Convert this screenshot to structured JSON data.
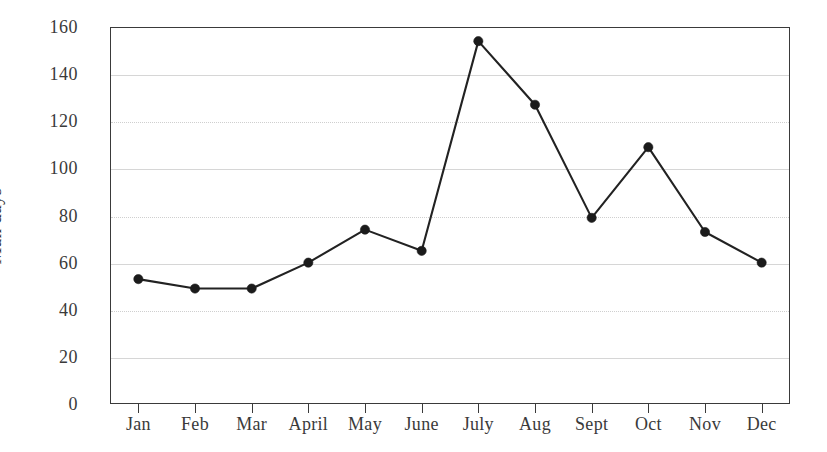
{
  "chart_data": {
    "type": "line",
    "title": "",
    "xlabel": "",
    "ylabel": "Man days",
    "categories": [
      "Jan",
      "Feb",
      "Mar",
      "April",
      "May",
      "June",
      "July",
      "Aug",
      "Sept",
      "Oct",
      "Nov",
      "Dec"
    ],
    "values": [
      53,
      49,
      49,
      60,
      74,
      65,
      154,
      127,
      79,
      109,
      73,
      60
    ],
    "series": [
      {
        "name": "Man days",
        "values": [
          53,
          49,
          49,
          60,
          74,
          65,
          154,
          127,
          79,
          109,
          73,
          60
        ]
      }
    ],
    "ylim": [
      0,
      160
    ],
    "yticks": [
      0,
      20,
      40,
      60,
      80,
      100,
      120,
      140,
      160
    ],
    "ytick_labels": [
      "0",
      "20",
      "40",
      "60",
      "80",
      "100",
      "120",
      "140",
      "160"
    ],
    "grid": true,
    "grid_axis": "y",
    "legend": false,
    "legend_position": "none",
    "marker": "filled-circle",
    "line_color": "#222222",
    "marker_color": "#1b1b1b",
    "grid_color": "#d6d6d6",
    "axis_color": "#3a3a3a",
    "background_color": "#ffffff"
  }
}
